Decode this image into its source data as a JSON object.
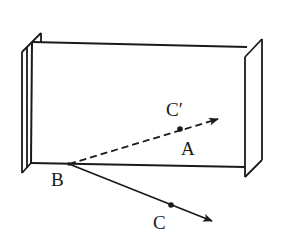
{
  "diagram": {
    "stroke_color": "#1a1a1a",
    "background": "#ffffff",
    "labels": {
      "B": "B",
      "A": "A",
      "C": "C",
      "C_prime": "C′"
    },
    "points": {
      "B": [
        69,
        164
      ],
      "A_point": [
        180,
        129
      ],
      "C_point": [
        171,
        205
      ],
      "dashed_arrow_tip": [
        218,
        119
      ],
      "solid_arrow_tip": [
        212,
        221
      ]
    }
  }
}
